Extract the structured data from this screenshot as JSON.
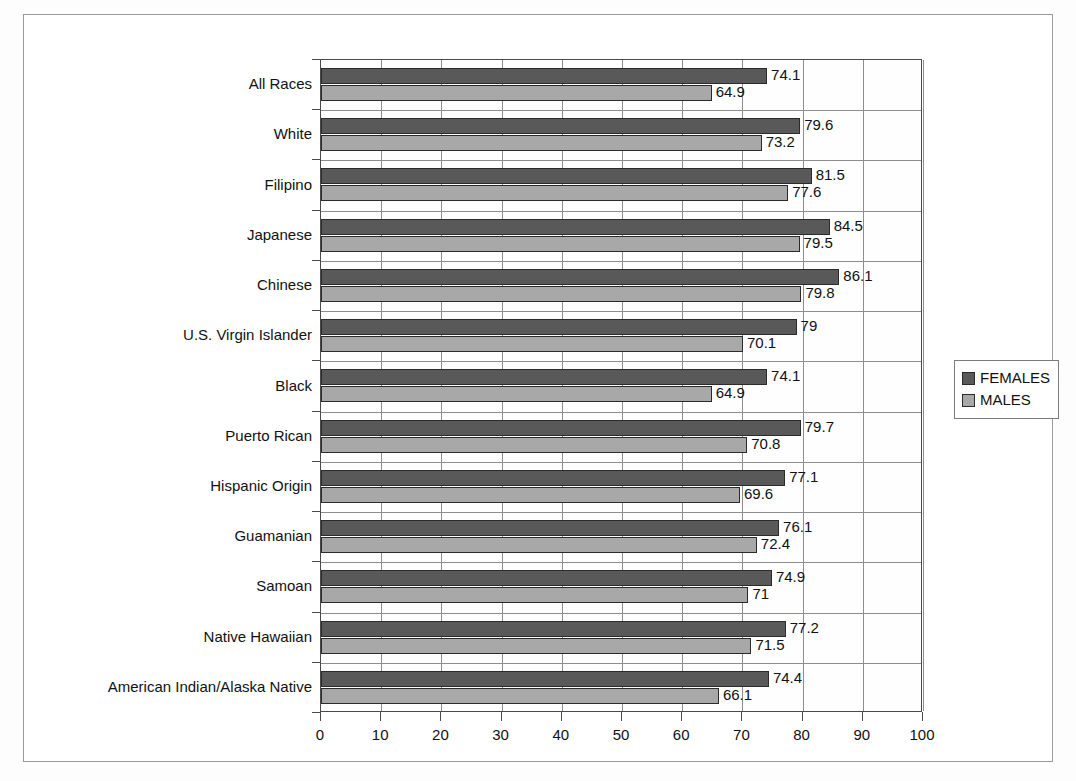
{
  "chart_data": {
    "type": "bar",
    "orientation": "horizontal",
    "title": "",
    "subtitle": "",
    "xlabel": "",
    "ylabel": "",
    "xlim": [
      0,
      100
    ],
    "xticks": [
      0,
      10,
      20,
      30,
      40,
      50,
      60,
      70,
      80,
      90,
      100
    ],
    "xtick_labels": [
      "0",
      "10",
      "20",
      "30",
      "40",
      "50",
      "60",
      "70",
      "80",
      "90",
      "100"
    ],
    "grid": true,
    "grid_axis": "x",
    "legend_position": "right",
    "categories": [
      "All Races",
      "White",
      "Filipino",
      "Japanese",
      "Chinese",
      "U.S. Virgin Islander",
      "Black",
      "Puerto Rican",
      "Hispanic Origin",
      "Guamanian",
      "Samoan",
      "Native Hawaiian",
      "American Indian/Alaska Native"
    ],
    "series": [
      {
        "name": "FEMALES",
        "color": "#595959",
        "values": [
          74.1,
          79.6,
          81.5,
          84.5,
          86.1,
          79,
          74.1,
          79.7,
          77.1,
          76.1,
          74.9,
          77.2,
          74.4
        ],
        "labels": [
          "74.1",
          "79.6",
          "81.5",
          "84.5",
          "86.1",
          "79",
          "74.1",
          "79.7",
          "77.1",
          "76.1",
          "74.9",
          "77.2",
          "74.4"
        ]
      },
      {
        "name": "MALES",
        "color": "#a8a8a8",
        "values": [
          64.9,
          73.2,
          77.6,
          79.5,
          79.8,
          70.1,
          64.9,
          70.8,
          69.6,
          72.4,
          71,
          71.5,
          66.1
        ],
        "labels": [
          "64.9",
          "73.2",
          "77.6",
          "79.5",
          "79.8",
          "70.1",
          "64.9",
          "70.8",
          "69.6",
          "72.4",
          "71",
          "71.5",
          "66.1"
        ]
      }
    ]
  },
  "legend": {
    "entries": [
      {
        "label": "FEMALES",
        "color": "#595959"
      },
      {
        "label": "MALES",
        "color": "#a8a8a8"
      }
    ]
  },
  "colors": {
    "females": "#595959",
    "males": "#a8a8a8",
    "axis": "#4a4a4a",
    "grid": "#8d8d8d",
    "frame": "#9a9a9a"
  }
}
